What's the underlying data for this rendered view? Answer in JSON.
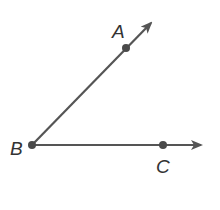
{
  "diagram": {
    "type": "angle",
    "vertex": {
      "label": "B",
      "x": 32,
      "y": 145
    },
    "rays": [
      {
        "name": "ray-BA",
        "point": {
          "label": "A",
          "x": 126,
          "y": 48
        },
        "tip": {
          "x": 152,
          "y": 22
        }
      },
      {
        "name": "ray-BC",
        "point": {
          "label": "C",
          "x": 163,
          "y": 145
        },
        "tip": {
          "x": 202,
          "y": 145
        }
      }
    ],
    "colors": {
      "line": "#555555",
      "point": "#4a4a4a",
      "label": "#333333"
    }
  }
}
